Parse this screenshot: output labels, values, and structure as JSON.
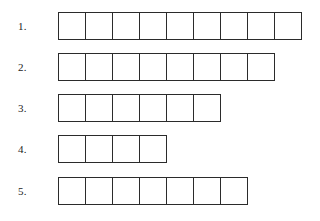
{
  "page": {
    "background_color": "#ffffff",
    "line_color": "#2b2b2b",
    "text_color": "#1c1c1c"
  },
  "rows": [
    {
      "label": "1.",
      "cell_count": 9
    },
    {
      "label": "2.",
      "cell_count": 8
    },
    {
      "label": "3.",
      "cell_count": 6
    },
    {
      "label": "4.",
      "cell_count": 4
    },
    {
      "label": "5.",
      "cell_count": 7
    }
  ]
}
